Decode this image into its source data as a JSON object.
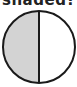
{
  "question": {
    "text": "shaded?"
  },
  "figure": {
    "shape": "circle",
    "parts": 2,
    "division": "vertical",
    "shaded_parts": 1,
    "shaded_side": "left",
    "colors": {
      "shaded": "#d3d3d3",
      "unshaded": "#ffffff",
      "outline": "#1a1a1a"
    }
  }
}
